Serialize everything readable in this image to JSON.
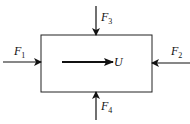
{
  "diagram": {
    "type": "free-body force diagram",
    "body": "rectangle",
    "forces": [
      {
        "id": "F1",
        "label": "F",
        "subscript": "1",
        "direction": "right",
        "side": "left"
      },
      {
        "id": "F2",
        "label": "F",
        "subscript": "2",
        "direction": "left",
        "side": "right"
      },
      {
        "id": "F3",
        "label": "F",
        "subscript": "3",
        "direction": "down",
        "side": "top"
      },
      {
        "id": "F4",
        "label": "F",
        "subscript": "4",
        "direction": "up",
        "side": "bottom"
      }
    ],
    "velocity": {
      "label": "U",
      "direction": "right"
    }
  }
}
